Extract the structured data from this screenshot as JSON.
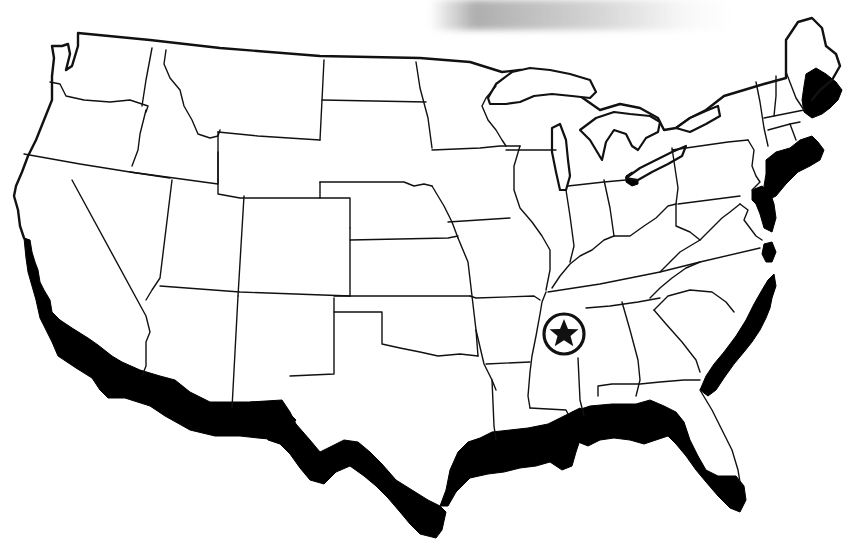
{
  "map": {
    "subject": "United States outline map (contiguous 48 states)",
    "style": "black and white line drawing",
    "highlight": {
      "description": "Coastal band shaded black",
      "color": "#000000",
      "regions": [
        "Pacific coast (California)",
        "Gulf coast (Texas to Florida)",
        "Atlantic coast (Florida to Maine)"
      ]
    },
    "marker": {
      "icon": "star-in-circle",
      "location_hint": "northern Mississippi / southwest Tennessee",
      "color": "#111111"
    },
    "colors": {
      "background": "#ffffff",
      "border_lines": "#111111",
      "coast_fill": "#000000",
      "top_smudge": "#8c8c8c"
    }
  }
}
